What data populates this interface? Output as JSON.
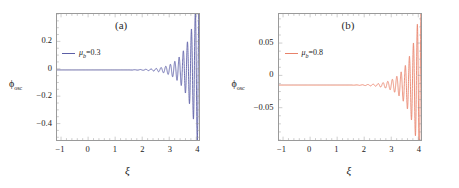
{
  "figure": {
    "background": "#ffffff",
    "width": 459,
    "height": 188,
    "frame_color": "#9a9a9a"
  },
  "panels": [
    {
      "id": "a",
      "label": "(a)",
      "line_color": "#5b5ea6",
      "legend": {
        "symbol": "μ",
        "subscript": "b",
        "equals": "=",
        "value": "0.3",
        "full": "μₖ=0.3"
      },
      "ylabel": {
        "symbol": "ϕ",
        "subscript": "osc",
        "full": "ϕosc"
      },
      "xlabel": "ξ",
      "yticks": [
        "0.2",
        "0.0",
        "-0.2",
        "-0.4"
      ],
      "ytick_values": [
        0.2,
        0.0,
        -0.2,
        -0.4
      ],
      "xticks": [
        "-1",
        "0",
        "1",
        "2",
        "3",
        "4"
      ],
      "xtick_values": [
        -1,
        0,
        1,
        2,
        3,
        4
      ]
    },
    {
      "id": "b",
      "label": "(b)",
      "line_color": "#e8826a",
      "legend": {
        "symbol": "μ",
        "subscript": "b",
        "equals": "=",
        "value": "0.8",
        "full": "μₖ=0.8"
      },
      "ylabel": {
        "symbol": "ϕ",
        "subscript": "osc",
        "full": "ϕosc"
      },
      "xlabel": "ξ",
      "yticks": [
        "0.05",
        "0.00",
        "-0.05"
      ],
      "ytick_values": [
        0.05,
        0.0,
        -0.05
      ],
      "xticks": [
        "-1",
        "0",
        "1",
        "2",
        "3",
        "4"
      ],
      "xtick_values": [
        -1,
        0,
        1,
        2,
        3,
        4
      ]
    }
  ],
  "chart_data": [
    {
      "type": "line",
      "panel": "a",
      "title": "(a)",
      "xlabel": "ξ",
      "ylabel": "ϕosc",
      "legend": [
        "μ_b=0.3"
      ],
      "legend_position": "upper-left-inside",
      "grid": false,
      "color": "#5b5ea6",
      "xlim": [
        -1.15,
        4.1
      ],
      "ylim": [
        -0.52,
        0.4
      ],
      "xticks": [
        -1,
        0,
        1,
        2,
        3,
        4
      ],
      "yticks": [
        0.2,
        0.0,
        -0.2,
        -0.4
      ],
      "minor_ticks": true,
      "baseline": -0.008,
      "description": "Flat near zero from xi=-1 to about xi=2, then growing oscillations whose amplitude increases sharply toward xi=4; largest positive peak approx +0.36 near xi=3.93, largest negative trough approx -0.48 at xi=4.0",
      "series": [
        {
          "name": "μ_b=0.3",
          "x": [
            -1.0,
            -0.8,
            -0.6,
            -0.4,
            -0.2,
            0.0,
            0.2,
            0.4,
            0.6,
            0.8,
            1.0,
            1.2,
            1.4,
            1.6,
            1.8,
            2.0,
            2.1,
            2.2,
            2.3,
            2.4,
            2.5,
            2.6,
            2.7,
            2.8,
            2.9,
            3.0,
            3.1,
            3.2,
            3.3,
            3.4,
            3.5,
            3.6,
            3.7,
            3.8,
            3.9,
            3.95,
            4.0
          ],
          "y": [
            -0.008,
            -0.008,
            -0.008,
            -0.008,
            -0.008,
            -0.008,
            -0.008,
            -0.008,
            -0.008,
            -0.008,
            -0.008,
            -0.008,
            -0.008,
            -0.008,
            -0.009,
            -0.012,
            -0.016,
            -0.02,
            -0.026,
            -0.032,
            -0.04,
            -0.05,
            -0.062,
            -0.075,
            -0.092,
            -0.11,
            -0.13,
            -0.155,
            -0.18,
            -0.21,
            -0.24,
            -0.28,
            -0.32,
            -0.37,
            -0.42,
            -0.45,
            -0.48
          ]
        }
      ],
      "envelope_note": "oscillation envelope grows roughly exponentially; about 14 visible oscillation cycles between xi=2 and xi=4"
    },
    {
      "type": "line",
      "panel": "b",
      "title": "(b)",
      "xlabel": "ξ",
      "ylabel": "ϕosc",
      "legend": [
        "μ_b=0.8"
      ],
      "legend_position": "upper-left-inside",
      "grid": false,
      "color": "#e8826a",
      "xlim": [
        -1.15,
        4.1
      ],
      "ylim": [
        -0.1,
        0.095
      ],
      "xticks": [
        -1,
        0,
        1,
        2,
        3,
        4
      ],
      "yticks": [
        0.05,
        0.0,
        -0.05
      ],
      "minor_ticks": true,
      "baseline": -0.015,
      "description": "Flat at about -0.015 from xi=-1 to about xi=2, then growing oscillations; largest positive peak approx +0.088 near xi=3.97, largest negative trough approx -0.092 near xi=3.80",
      "series": [
        {
          "name": "μ_b=0.8",
          "x": [
            -1.0,
            -0.8,
            -0.6,
            -0.4,
            -0.2,
            0.0,
            0.2,
            0.4,
            0.6,
            0.8,
            1.0,
            1.2,
            1.4,
            1.6,
            1.8,
            2.0,
            2.1,
            2.2,
            2.3,
            2.4,
            2.5,
            2.6,
            2.7,
            2.8,
            2.9,
            3.0,
            3.1,
            3.2,
            3.3,
            3.4,
            3.5,
            3.6,
            3.7,
            3.8,
            3.9,
            3.97,
            4.0
          ],
          "y": [
            -0.015,
            -0.015,
            -0.015,
            -0.015,
            -0.015,
            -0.015,
            -0.015,
            -0.015,
            -0.015,
            -0.015,
            -0.015,
            -0.015,
            -0.015,
            -0.016,
            -0.016,
            -0.017,
            -0.018,
            -0.019,
            -0.021,
            -0.023,
            -0.025,
            -0.028,
            -0.031,
            -0.034,
            -0.038,
            -0.043,
            -0.048,
            -0.054,
            -0.06,
            -0.067,
            -0.074,
            -0.08,
            -0.086,
            -0.092,
            0.05,
            0.088,
            0.02
          ]
        }
      ],
      "envelope_note": "oscillation envelope grows roughly exponentially; about 14 visible oscillation cycles between xi=2 and xi=4"
    }
  ]
}
